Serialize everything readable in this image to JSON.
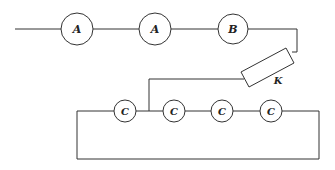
{
  "diagram": {
    "type": "circuit",
    "background": "#ffffff",
    "stroke_color": "#333333",
    "components": [
      {
        "id": "A1",
        "label": "A",
        "shape": "circle",
        "cx": 77,
        "cy": 29,
        "r": 16
      },
      {
        "id": "A2",
        "label": "A",
        "shape": "circle",
        "cx": 155,
        "cy": 29,
        "r": 16
      },
      {
        "id": "B",
        "label": "B",
        "shape": "circle",
        "cx": 233,
        "cy": 29,
        "r": 15
      },
      {
        "id": "K",
        "label": "K",
        "shape": "rectangle-rotated"
      },
      {
        "id": "C1",
        "label": "C",
        "shape": "circle",
        "cx": 125,
        "cy": 111,
        "r": 11
      },
      {
        "id": "C2",
        "label": "C",
        "shape": "circle",
        "cx": 174,
        "cy": 111,
        "r": 11
      },
      {
        "id": "C3",
        "label": "C",
        "shape": "circle",
        "cx": 222,
        "cy": 111,
        "r": 11
      },
      {
        "id": "C4",
        "label": "C",
        "shape": "circle",
        "cx": 271,
        "cy": 111,
        "r": 11
      }
    ],
    "labels": {
      "a1": "A",
      "a2": "A",
      "b": "B",
      "k": "K",
      "c1": "C",
      "c2": "C",
      "c3": "C",
      "c4": "C"
    }
  }
}
